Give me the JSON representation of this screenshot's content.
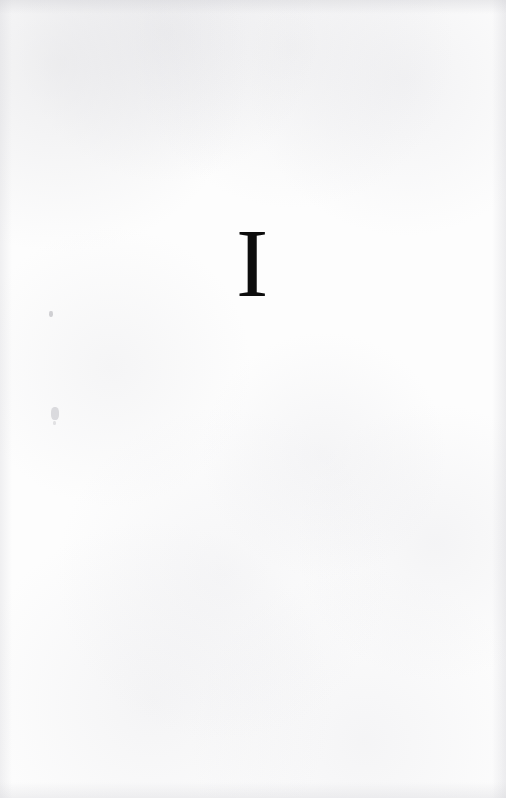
{
  "document": {
    "kind": "scanned-book-page",
    "page_type": "part-title",
    "page_width": 506,
    "page_height": 798
  },
  "page": {
    "numeral": "I",
    "numeral_style": "roman",
    "paper_color": "#fdfdfd",
    "ink_color": "#0d0d0d"
  },
  "artifacts": {
    "specks": [
      {
        "name": "scan-speck-upper",
        "x": 49,
        "y": 311
      },
      {
        "name": "scan-speck-lower",
        "x": 51,
        "y": 407
      },
      {
        "name": "scan-speck-lower-dot",
        "x": 53,
        "y": 421
      }
    ]
  }
}
